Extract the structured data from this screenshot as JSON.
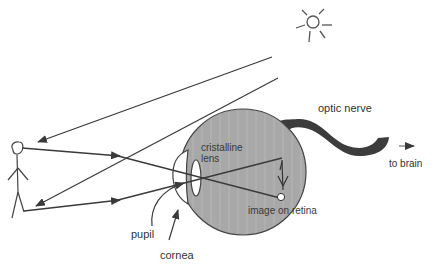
{
  "diagram": {
    "labels": {
      "optic_nerve": "optic nerve",
      "to_brain": "to brain",
      "cristalline_lens_line1": "cristalline",
      "cristalline_lens_line2": "lens",
      "image_on_retina": "image on retina",
      "pupil": "pupil",
      "cornea": "cornea"
    },
    "elements": [
      "sun",
      "stick-figure",
      "eyeball",
      "cornea",
      "lens",
      "optic-nerve",
      "light-rays",
      "inverted-image"
    ],
    "colors": {
      "eyeball_fill": "#a9a9a9",
      "nerve_fill": "#3c3c3c",
      "line": "#3a3a3a",
      "background": "#ffffff"
    }
  }
}
